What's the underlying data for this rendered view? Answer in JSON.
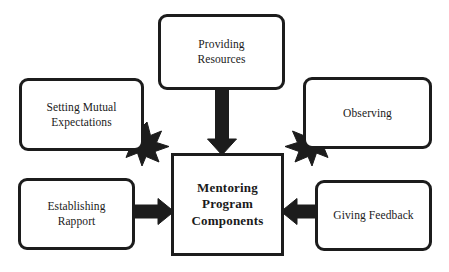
{
  "diagram": {
    "title": "Mentoring Program Components",
    "type": "hub-and-spoke",
    "background_color": "#ffffff",
    "line_color": "#1c1c1c",
    "center": {
      "id": "mentoring-program-components",
      "label": "Mentoring\nProgram\nComponents",
      "shape": "rectangle",
      "bold": true
    },
    "nodes": [
      {
        "id": "providing-resources",
        "label": "Providing\nResources",
        "position": "top",
        "shape": "rounded-rectangle"
      },
      {
        "id": "setting-mutual-expectations",
        "label": "Setting Mutual\nExpectations",
        "position": "top-left",
        "shape": "rounded-rectangle"
      },
      {
        "id": "observing",
        "label": "Observing",
        "position": "top-right",
        "shape": "rounded-rectangle"
      },
      {
        "id": "establishing-rapport",
        "label": "Establishing\nRapport",
        "position": "bottom-left",
        "shape": "rounded-rectangle"
      },
      {
        "id": "giving-feedback",
        "label": "Giving Feedback",
        "position": "bottom-right",
        "shape": "rounded-rectangle"
      }
    ],
    "arrows": [
      {
        "id": "arrow-providing-resources",
        "from": "providing-resources",
        "to": "mentoring-program-components",
        "direction": "down"
      },
      {
        "id": "arrow-setting-mutual-expectations",
        "from": "setting-mutual-expectations",
        "to": "mentoring-program-components",
        "direction": "down-right"
      },
      {
        "id": "arrow-observing",
        "from": "observing",
        "to": "mentoring-program-components",
        "direction": "down-left"
      },
      {
        "id": "arrow-establishing-rapport",
        "from": "establishing-rapport",
        "to": "mentoring-program-components",
        "direction": "right"
      },
      {
        "id": "arrow-giving-feedback",
        "from": "giving-feedback",
        "to": "mentoring-program-components",
        "direction": "left"
      }
    ]
  }
}
